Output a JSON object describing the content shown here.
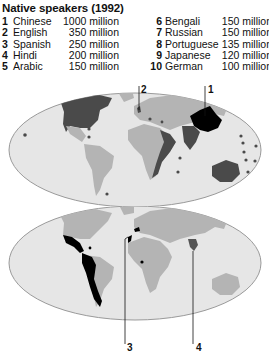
{
  "title": "Native speakers (1992)",
  "legend": [
    {
      "rank": "1",
      "language": "Chinese",
      "speakers": "1000 million"
    },
    {
      "rank": "2",
      "language": "English",
      "speakers": "350 million"
    },
    {
      "rank": "3",
      "language": "Spanish",
      "speakers": "250 million"
    },
    {
      "rank": "4",
      "language": "Hindi",
      "speakers": "200 million"
    },
    {
      "rank": "5",
      "language": "Arabic",
      "speakers": "150 million"
    },
    {
      "rank": "6",
      "language": "Bengali",
      "speakers": "150 million"
    },
    {
      "rank": "7",
      "language": "Russian",
      "speakers": "150 million"
    },
    {
      "rank": "8",
      "language": "Portuguese",
      "speakers": "135 million"
    },
    {
      "rank": "9",
      "language": "Japanese",
      "speakers": "120 million"
    },
    {
      "rank": "10",
      "language": "German",
      "speakers": "100 million"
    }
  ],
  "maps": {
    "top": {
      "callouts": [
        {
          "label": "2",
          "language": "English"
        },
        {
          "label": "1",
          "language": "Chinese"
        }
      ]
    },
    "bottom": {
      "callouts": [
        {
          "label": "3",
          "language": "Spanish"
        },
        {
          "label": "4",
          "language": "Hindi"
        }
      ]
    }
  },
  "colors": {
    "ocean": "#e6e6e6",
    "land": "#b4b4b4",
    "english": "#4a4a4a",
    "chinese": "#000000",
    "spanish": "#000000",
    "hindi": "#555555",
    "outline": "#9a9a9a"
  }
}
